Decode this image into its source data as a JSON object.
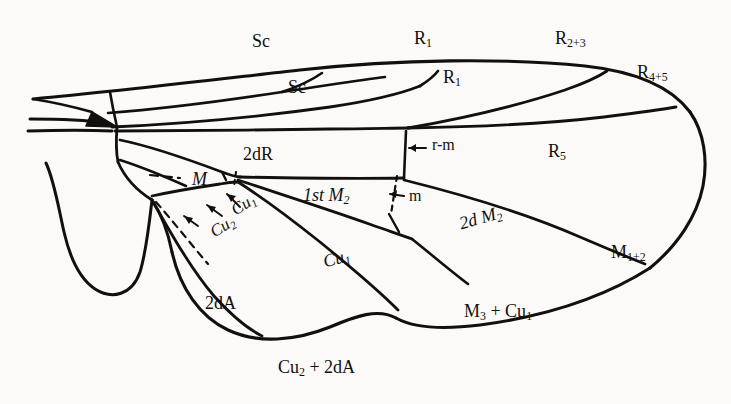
{
  "figure": {
    "type": "insect-wing-venation-diagram",
    "background_color": "#fbfaf8",
    "ink_color": "#12100e"
  },
  "labels": [
    {
      "key": "sc_outer",
      "text": "Sc",
      "base": "Sc",
      "sub": "",
      "x": 252,
      "y": 32,
      "size": 18,
      "italic": false,
      "rotate": 0,
      "name": "label-sc-outer"
    },
    {
      "key": "sc_inner",
      "text": "Sc",
      "base": "Sc",
      "sub": "",
      "x": 288,
      "y": 78,
      "size": 18,
      "italic": false,
      "rotate": 0,
      "name": "label-sc-inner"
    },
    {
      "key": "r1_outer",
      "text": "R1",
      "base": "R",
      "sub": "1",
      "x": 414,
      "y": 29,
      "size": 18,
      "italic": false,
      "rotate": 0,
      "name": "label-r1-outer"
    },
    {
      "key": "r1_inner",
      "text": "R1",
      "base": "R",
      "sub": "1",
      "x": 443,
      "y": 68,
      "size": 18,
      "italic": false,
      "rotate": 0,
      "name": "label-r1-inner"
    },
    {
      "key": "r23",
      "text": "R2+3",
      "base": "R",
      "sub": "2+3",
      "x": 555,
      "y": 29,
      "size": 18,
      "italic": false,
      "rotate": 0,
      "name": "label-r2-plus-3"
    },
    {
      "key": "r45",
      "text": "R4+5",
      "base": "R",
      "sub": "4+5",
      "x": 637,
      "y": 63,
      "size": 18,
      "italic": false,
      "rotate": 0,
      "name": "label-r4-plus-5"
    },
    {
      "key": "r5",
      "text": "R5",
      "base": "R",
      "sub": "5",
      "x": 548,
      "y": 142,
      "size": 18,
      "italic": false,
      "rotate": 0,
      "name": "label-r5"
    },
    {
      "key": "twodr",
      "text": "2dR",
      "base": "2dR",
      "sub": "",
      "x": 243,
      "y": 145,
      "size": 18,
      "italic": false,
      "rotate": 0,
      "name": "label-2dr-cell"
    },
    {
      "key": "rm",
      "text": "r-m",
      "base": "r-m",
      "sub": "",
      "x": 432,
      "y": 144,
      "size": 16,
      "italic": false,
      "rotate": 0,
      "name": "label-r-m-crossvein"
    },
    {
      "key": "m_cell",
      "text": "M",
      "base": "M",
      "sub": "",
      "x": 192,
      "y": 170,
      "size": 18,
      "italic": true,
      "rotate": 0,
      "name": "label-m-cell"
    },
    {
      "key": "first_m2",
      "text": "1st M2",
      "base": "1st M",
      "sub": "2",
      "x": 303,
      "y": 186,
      "size": 18,
      "italic": true,
      "rotate": 0,
      "name": "label-1st-m2-cell"
    },
    {
      "key": "m_cross",
      "text": "m",
      "base": "m",
      "sub": "",
      "x": 409,
      "y": 191,
      "size": 16,
      "italic": false,
      "rotate": 0,
      "name": "label-m-crossvein"
    },
    {
      "key": "cu1_arrow",
      "text": "Cu1",
      "base": "Cu",
      "sub": "1",
      "x": 228,
      "y": 204,
      "size": 17,
      "italic": true,
      "rotate": -32,
      "name": "label-cu1-vein"
    },
    {
      "key": "cu2_arrow",
      "text": "Cu2",
      "base": "Cu",
      "sub": "2",
      "x": 207,
      "y": 226,
      "size": 17,
      "italic": true,
      "rotate": -32,
      "name": "label-cu2-vein"
    },
    {
      "key": "twodm2",
      "text": "2d M2",
      "base": "2d M",
      "sub": "2",
      "x": 457,
      "y": 215,
      "size": 18,
      "italic": true,
      "rotate": -18,
      "name": "label-2d-m2-cell"
    },
    {
      "key": "cu1_cell",
      "text": "Cu1",
      "base": "Cu",
      "sub": "1",
      "x": 321,
      "y": 253,
      "size": 18,
      "italic": true,
      "rotate": -17,
      "name": "label-cu1-cell"
    },
    {
      "key": "m12",
      "text": "M1+2",
      "base": "M",
      "sub": "1+2",
      "x": 611,
      "y": 243,
      "size": 18,
      "italic": false,
      "rotate": 0,
      "name": "label-m1-plus-2"
    },
    {
      "key": "twoda",
      "text": "2dA",
      "base": "2dA",
      "sub": "",
      "x": 205,
      "y": 294,
      "size": 18,
      "italic": false,
      "rotate": 0,
      "name": "label-2da-cell"
    },
    {
      "key": "m3cu1",
      "text": "M3 + Cu1",
      "base": "M",
      "sub": "3",
      "x": 464,
      "y": 302,
      "size": 18,
      "italic": false,
      "rotate": 0,
      "name": "label-m3-plus-cu1"
    },
    {
      "key": "cu2_2da",
      "text": "Cu2 + 2dA",
      "base": "Cu",
      "sub": "2",
      "x": 278,
      "y": 358,
      "size": 18,
      "italic": false,
      "rotate": 0,
      "name": "label-cu2-plus-2da"
    }
  ],
  "compound_labels": {
    "m3cu1_parts": {
      "first": "M",
      "first_sub": "3",
      "plus": " + ",
      "second": "Cu",
      "second_sub": "1"
    },
    "cu2_2da_parts": {
      "first": "Cu",
      "first_sub": "2",
      "plus": " + ",
      "second": "2dA"
    }
  },
  "structures": {
    "costal_margin": "leading edge of wing",
    "apex": "rounded wing tip at right",
    "alula": "basal posterior lobe at lower left",
    "anal_lobe": "posterior lobe adjacent to alula",
    "humeral_thickening": "dark wedge at wing base"
  }
}
